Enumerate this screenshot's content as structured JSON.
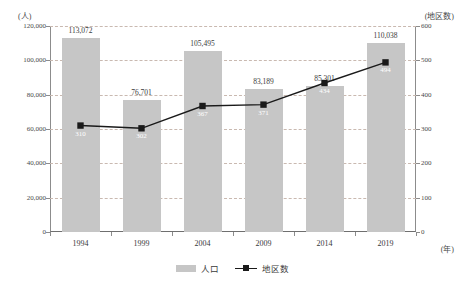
{
  "axis_units": {
    "left": "(人)",
    "right": "(地区数)",
    "x": "(年)"
  },
  "legend": {
    "bar_label": "人口",
    "line_label": "地区数"
  },
  "colors": {
    "bar": "#c6c6c6",
    "line": "#1a1a1a",
    "grid": "#c9b9b0",
    "axis": "#8c8c8c",
    "text": "#3a3a3a",
    "line_label_text": "#ffffff"
  },
  "chart_data": {
    "type": "bar",
    "title": "",
    "subtitle": "",
    "xlabel": "(年)",
    "ylabel": "(人)",
    "y2label": "(地区数)",
    "categories": [
      "1994",
      "1999",
      "2004",
      "2009",
      "2014",
      "2019"
    ],
    "ylim": [
      0,
      120000
    ],
    "y2lim": [
      0,
      600
    ],
    "yticks": [
      "0",
      "20,000",
      "40,000",
      "60,000",
      "80,000",
      "100,000",
      "120,000"
    ],
    "ytick_values": [
      0,
      20000,
      40000,
      60000,
      80000,
      100000,
      120000
    ],
    "y2ticks": [
      "0",
      "100",
      "200",
      "300",
      "400",
      "500",
      "600"
    ],
    "y2tick_values": [
      0,
      100,
      200,
      300,
      400,
      500,
      600
    ],
    "grid": true,
    "legend_position": "bottom",
    "series": [
      {
        "name": "人口",
        "type": "bar",
        "axis": "left",
        "values": [
          113072,
          76701,
          105495,
          83189,
          85301,
          110038
        ],
        "labels": [
          "113,072",
          "76,701",
          "105,495",
          "83,189",
          "85,301",
          "110,038"
        ]
      },
      {
        "name": "地区数",
        "type": "line",
        "axis": "right",
        "values": [
          310,
          302,
          367,
          371,
          434,
          494
        ],
        "labels": [
          "310",
          "302",
          "367",
          "371",
          "434",
          "494"
        ]
      }
    ]
  }
}
